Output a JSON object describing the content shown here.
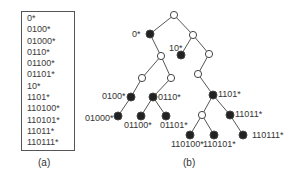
{
  "panel_a": {
    "prefixes": [
      "0*",
      "0100*",
      "01000*",
      "0110*",
      "01100*",
      "01101*",
      "10*",
      "1101*",
      "110100*",
      "110101*",
      "11011*",
      "110111*"
    ],
    "caption": "(a)"
  },
  "panel_b": {
    "caption": "(b)",
    "nodes": [
      {
        "id": "root",
        "x": 174,
        "y": 15,
        "filled": false,
        "label": ""
      },
      {
        "id": "n0",
        "x": 150,
        "y": 34,
        "filled": true,
        "label": "0*",
        "lx": 132,
        "ly": 37
      },
      {
        "id": "n1",
        "x": 193,
        "y": 35,
        "filled": false,
        "label": ""
      },
      {
        "id": "n01",
        "x": 161,
        "y": 56,
        "filled": false,
        "label": ""
      },
      {
        "id": "n10",
        "x": 181,
        "y": 55,
        "filled": true,
        "label": "10*",
        "lx": 169,
        "ly": 51
      },
      {
        "id": "n11",
        "x": 209,
        "y": 54,
        "filled": false,
        "label": ""
      },
      {
        "id": "n010",
        "x": 142,
        "y": 78,
        "filled": false,
        "label": ""
      },
      {
        "id": "n011",
        "x": 171,
        "y": 78,
        "filled": false,
        "label": ""
      },
      {
        "id": "n110",
        "x": 198,
        "y": 74,
        "filled": false,
        "label": ""
      },
      {
        "id": "n0100",
        "x": 131,
        "y": 97,
        "filled": true,
        "label": "0100*",
        "lx": 102,
        "ly": 99
      },
      {
        "id": "n0110",
        "x": 153,
        "y": 97,
        "filled": true,
        "label": "0110*",
        "lx": 158,
        "ly": 100
      },
      {
        "id": "n1101",
        "x": 213,
        "y": 95,
        "filled": true,
        "label": "1101*",
        "lx": 218,
        "ly": 97
      },
      {
        "id": "n01000",
        "x": 118,
        "y": 116,
        "filled": true,
        "label": "01000*",
        "lx": 85,
        "ly": 121
      },
      {
        "id": "n01100",
        "x": 141,
        "y": 116,
        "filled": true,
        "label": "01100*",
        "lx": 124,
        "ly": 128
      },
      {
        "id": "n01101",
        "x": 166,
        "y": 116,
        "filled": true,
        "label": "01101*",
        "lx": 160,
        "ly": 128
      },
      {
        "id": "n11010",
        "x": 202,
        "y": 115,
        "filled": false,
        "label": ""
      },
      {
        "id": "n11011",
        "x": 230,
        "y": 115,
        "filled": true,
        "label": "11011*",
        "lx": 235,
        "ly": 117
      },
      {
        "id": "n110100",
        "x": 190,
        "y": 135,
        "filled": true,
        "label": "110100*",
        "lx": 171,
        "ly": 147
      },
      {
        "id": "n110101",
        "x": 214,
        "y": 135,
        "filled": true,
        "label": "110101*",
        "lx": 203,
        "ly": 147
      },
      {
        "id": "n110111",
        "x": 243,
        "y": 135,
        "filled": true,
        "label": "110111*",
        "lx": 252,
        "ly": 138
      }
    ],
    "edges": [
      [
        "root",
        "n0"
      ],
      [
        "root",
        "n1"
      ],
      [
        "n0",
        "n01"
      ],
      [
        "n1",
        "n10"
      ],
      [
        "n1",
        "n11"
      ],
      [
        "n01",
        "n010"
      ],
      [
        "n01",
        "n011"
      ],
      [
        "n11",
        "n110"
      ],
      [
        "n010",
        "n0100"
      ],
      [
        "n011",
        "n0110"
      ],
      [
        "n110",
        "n1101"
      ],
      [
        "n0100",
        "n01000"
      ],
      [
        "n0110",
        "n01100"
      ],
      [
        "n0110",
        "n01101"
      ],
      [
        "n1101",
        "n11010"
      ],
      [
        "n1101",
        "n11011"
      ],
      [
        "n11010",
        "n110100"
      ],
      [
        "n11010",
        "n110101"
      ],
      [
        "n11011",
        "n110111"
      ]
    ]
  }
}
